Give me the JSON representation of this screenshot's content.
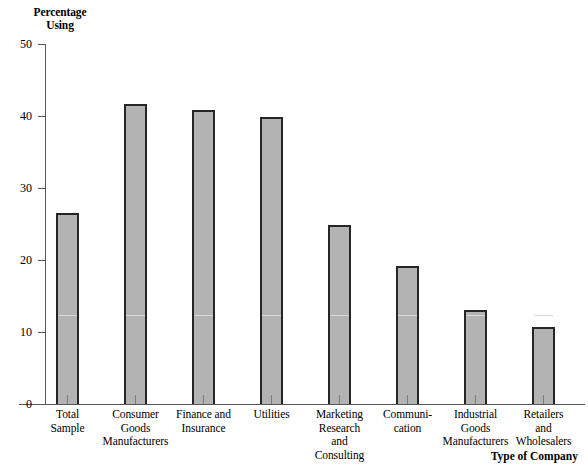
{
  "chart_data": {
    "type": "bar",
    "title": "",
    "xlabel": "Type of Company",
    "ylabel": "Percentage Using",
    "ylabel_lines": [
      "Percentage",
      "Using"
    ],
    "ylim": [
      0,
      50
    ],
    "ytick_values": [
      0,
      10,
      20,
      30,
      40,
      50
    ],
    "ytick_labels": [
      "0",
      "10",
      "20",
      "30",
      "40",
      "50"
    ],
    "grid": false,
    "legend": "none",
    "bar_fill_color": "#b3b3b3",
    "bar_edge_color": "#262626",
    "bar_midline_color": "#d9d9d9",
    "bar_midline_value": 12.2,
    "categories": [
      "Total Sample",
      "Consumer Goods Manufacturers",
      "Finance and Insurance",
      "Utilities",
      "Marketing Research and Consulting",
      "Communication",
      "Industrial Goods Manufacturers",
      "Retailers and Wholesalers"
    ],
    "category_label_lines": [
      [
        "Total",
        "Sample"
      ],
      [
        "Consumer",
        "Goods",
        "Manufacturers"
      ],
      [
        "Finance and",
        "Insurance"
      ],
      [
        "Utilities"
      ],
      [
        "Marketing",
        "Research",
        "and",
        "Consulting"
      ],
      [
        "Communi-",
        "cation"
      ],
      [
        "Industrial",
        "Goods",
        "Manufacturers"
      ],
      [
        "Retailers",
        "and",
        "Wholesalers"
      ]
    ],
    "values": [
      26.5,
      41.6,
      40.8,
      39.8,
      24.8,
      19.2,
      13.1,
      10.7
    ]
  }
}
